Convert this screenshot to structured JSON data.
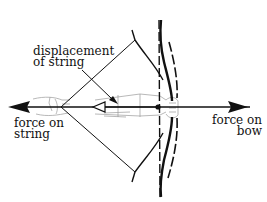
{
  "diagram": {
    "type": "physics-illustration",
    "labels": {
      "displacement": {
        "line1": "displacement",
        "line2": "of string"
      },
      "force_on_string": {
        "line1": "force on",
        "line2": "string"
      },
      "force_on_bow": {
        "line1": "force on",
        "line2": "bow"
      }
    },
    "colors": {
      "ink": "#111111",
      "sketch": "#9a9a9a",
      "background": "#ffffff"
    },
    "elements": [
      "bow-drawn (solid curve)",
      "bow-relaxed (dashed vertical line)",
      "string-drawn (lines to nock point)",
      "arrow-shaft",
      "force-on-string arrow (left)",
      "force-on-bow arrow (right)",
      "displacement arrow (hollow head)",
      "archer arms (light sketch)"
    ]
  }
}
